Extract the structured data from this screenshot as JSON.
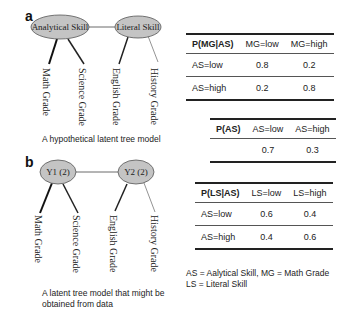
{
  "panel_a": {
    "label": "a",
    "latent_nodes": [
      "Analytical Skill",
      "Literal Skill"
    ],
    "leaves": [
      "Math Grade",
      "Science Grade",
      "English Grade",
      "History Grade"
    ],
    "caption": "A hypothetical latent tree model"
  },
  "panel_b": {
    "label": "b",
    "latent_nodes": [
      "Y1 (2)",
      "Y2 (2)"
    ],
    "leaves": [
      "Math Grade",
      "Science Grade",
      "English Grade",
      "History Grade"
    ],
    "caption_line1": "A latent tree model that might be",
    "caption_line2": "obtained from data"
  },
  "tables": {
    "mg_given_as": {
      "header": [
        "P(MG|AS)",
        "MG=low",
        "MG=high"
      ],
      "rows": [
        [
          "AS=low",
          "0.8",
          "0.2"
        ],
        [
          "AS=high",
          "0.2",
          "0.8"
        ]
      ]
    },
    "as": {
      "header": [
        "P(AS)",
        "AS=low",
        "AS=high"
      ],
      "rows": [
        [
          "",
          "0.7",
          "0.3"
        ]
      ]
    },
    "ls_given_as": {
      "header": [
        "P(LS|AS)",
        "LS=low",
        "LS=high"
      ],
      "rows": [
        [
          "AS=low",
          "0.6",
          "0.4"
        ],
        [
          "AS=high",
          "0.4",
          "0.6"
        ]
      ]
    }
  },
  "legend": {
    "line1": "AS = Aalytical Skill, MG = Math Grade",
    "line2": "LS = Literal Skill"
  },
  "colors": {
    "node_fill": "#c4c4c4",
    "node_stroke": "#555555",
    "edge": "#222222"
  }
}
